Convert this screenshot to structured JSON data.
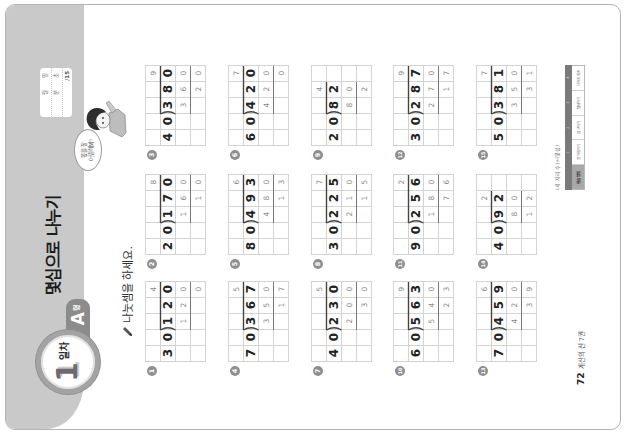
{
  "header": {
    "day_number": "1",
    "day_label": "일차",
    "type_letter": "A",
    "type_suffix": "형",
    "title": "몇십으로 나누기"
  },
  "score_box": {
    "month_label": "월",
    "day_label": "일",
    "minute_label": "분",
    "second_label": "초",
    "score_total": "/15"
  },
  "mascot": {
    "speech_line1": "몫을 잘",
    "speech_line2": "어림해봐!"
  },
  "instruction": {
    "icon": "pencil-icon",
    "text": "나눗셈을 하세요."
  },
  "problems": [
    {
      "number": "1",
      "divisor": "30",
      "dividend": "120",
      "quotient": "4",
      "product": "120",
      "remainder": "0",
      "rows": [
        [
          "",
          "",
          "",
          "",
          "4"
        ],
        [
          "3",
          "0",
          "1",
          "2",
          "0"
        ],
        [
          "",
          "",
          "1",
          "2",
          "0"
        ],
        [
          "",
          "",
          "",
          "",
          "0"
        ]
      ]
    },
    {
      "number": "2",
      "divisor": "20",
      "dividend": "170",
      "quotient": "8",
      "product": "160",
      "remainder": "10",
      "rows": [
        [
          "",
          "",
          "",
          "",
          "8"
        ],
        [
          "2",
          "0",
          "1",
          "7",
          "0"
        ],
        [
          "",
          "",
          "1",
          "6",
          "0"
        ],
        [
          "",
          "",
          "",
          "1",
          "0"
        ]
      ]
    },
    {
      "number": "3",
      "divisor": "40",
      "dividend": "380",
      "quotient": "9",
      "product": "360",
      "remainder": "20",
      "rows": [
        [
          "",
          "",
          "",
          "",
          "9"
        ],
        [
          "4",
          "0",
          "3",
          "8",
          "0"
        ],
        [
          "",
          "",
          "3",
          "6",
          "0"
        ],
        [
          "",
          "",
          "",
          "2",
          "0"
        ]
      ]
    },
    {
      "number": "4",
      "divisor": "70",
      "dividend": "367",
      "quotient": "5",
      "product": "350",
      "remainder": "17",
      "rows": [
        [
          "",
          "",
          "",
          "",
          "5"
        ],
        [
          "7",
          "0",
          "3",
          "6",
          "7"
        ],
        [
          "",
          "",
          "3",
          "5",
          "0"
        ],
        [
          "",
          "",
          "",
          "1",
          "7"
        ]
      ]
    },
    {
      "number": "5",
      "divisor": "80",
      "dividend": "493",
      "quotient": "6",
      "product": "480",
      "remainder": "13",
      "rows": [
        [
          "",
          "",
          "",
          "",
          "6"
        ],
        [
          "8",
          "0",
          "4",
          "9",
          "3"
        ],
        [
          "",
          "",
          "4",
          "8",
          "0"
        ],
        [
          "",
          "",
          "",
          "1",
          "3"
        ]
      ]
    },
    {
      "number": "6",
      "divisor": "60",
      "dividend": "420",
      "quotient": "7",
      "product": "420",
      "remainder": "0",
      "rows": [
        [
          "",
          "",
          "",
          "",
          "7"
        ],
        [
          "6",
          "0",
          "4",
          "2",
          "0"
        ],
        [
          "",
          "",
          "4",
          "2",
          "0"
        ],
        [
          "",
          "",
          "",
          "",
          "0"
        ]
      ]
    },
    {
      "number": "7",
      "divisor": "40",
      "dividend": "230",
      "quotient": "5",
      "product": "200",
      "remainder": "30",
      "rows": [
        [
          "",
          "",
          "",
          "",
          "5"
        ],
        [
          "4",
          "0",
          "2",
          "3",
          "0"
        ],
        [
          "",
          "",
          "2",
          "0",
          "0"
        ],
        [
          "",
          "",
          "",
          "3",
          "0"
        ]
      ]
    },
    {
      "number": "8",
      "divisor": "30",
      "dividend": "225",
      "quotient": "7",
      "product": "210",
      "remainder": "15",
      "rows": [
        [
          "",
          "",
          "",
          "",
          "7"
        ],
        [
          "3",
          "0",
          "2",
          "2",
          "5"
        ],
        [
          "",
          "",
          "2",
          "1",
          "0"
        ],
        [
          "",
          "",
          "",
          "1",
          "5"
        ]
      ]
    },
    {
      "number": "9",
      "divisor": "20",
      "dividend": "82",
      "quotient": "4",
      "product": "80",
      "remainder": "2",
      "rows": [
        [
          "",
          "",
          "",
          "4",
          ""
        ],
        [
          "2",
          "0",
          "8",
          "2",
          ""
        ],
        [
          "",
          "",
          "8",
          "0",
          ""
        ],
        [
          "",
          "",
          "",
          "2",
          ""
        ]
      ]
    },
    {
      "number": "10",
      "divisor": "60",
      "dividend": "563",
      "quotient": "9",
      "product": "540",
      "remainder": "23",
      "rows": [
        [
          "",
          "",
          "",
          "",
          "9"
        ],
        [
          "6",
          "0",
          "5",
          "6",
          "3"
        ],
        [
          "",
          "",
          "5",
          "4",
          "0"
        ],
        [
          "",
          "",
          "",
          "2",
          "3"
        ]
      ]
    },
    {
      "number": "11",
      "divisor": "90",
      "dividend": "256",
      "quotient": "2",
      "product": "180",
      "remainder": "76",
      "rows": [
        [
          "",
          "",
          "",
          "",
          "2"
        ],
        [
          "9",
          "0",
          "2",
          "5",
          "6"
        ],
        [
          "",
          "",
          "1",
          "8",
          "0"
        ],
        [
          "",
          "",
          "",
          "7",
          "6"
        ]
      ]
    },
    {
      "number": "12",
      "divisor": "30",
      "dividend": "287",
      "quotient": "9",
      "product": "270",
      "remainder": "17",
      "rows": [
        [
          "",
          "",
          "",
          "",
          "9"
        ],
        [
          "3",
          "0",
          "2",
          "8",
          "7"
        ],
        [
          "",
          "",
          "2",
          "7",
          "0"
        ],
        [
          "",
          "",
          "",
          "1",
          "7"
        ]
      ]
    },
    {
      "number": "13",
      "divisor": "70",
      "dividend": "459",
      "quotient": "6",
      "product": "420",
      "remainder": "39",
      "rows": [
        [
          "",
          "",
          "",
          "",
          "6"
        ],
        [
          "7",
          "0",
          "4",
          "5",
          "9"
        ],
        [
          "",
          "",
          "4",
          "2",
          "0"
        ],
        [
          "",
          "",
          "",
          "3",
          "9"
        ]
      ]
    },
    {
      "number": "14",
      "divisor": "40",
      "dividend": "92",
      "quotient": "2",
      "product": "80",
      "remainder": "12",
      "rows": [
        [
          "",
          "",
          "",
          "2",
          ""
        ],
        [
          "4",
          "0",
          "9",
          "2",
          ""
        ],
        [
          "",
          "",
          "8",
          "0",
          ""
        ],
        [
          "",
          "",
          "1",
          "2",
          ""
        ]
      ]
    },
    {
      "number": "15",
      "divisor": "50",
      "dividend": "381",
      "quotient": "7",
      "product": "350",
      "remainder": "31",
      "rows": [
        [
          "",
          "",
          "",
          "",
          "7"
        ],
        [
          "5",
          "0",
          "3",
          "8",
          "1"
        ],
        [
          "",
          "",
          "3",
          "5",
          "0"
        ],
        [
          "",
          "",
          "",
          "3",
          "1"
        ]
      ]
    }
  ],
  "footer": {
    "page_number": "72",
    "book_title": "계산의 신 7권",
    "note": "(세 자리 수)÷(몇십)",
    "table": {
      "headers": [
        "",
        "1",
        "2",
        "3",
        "4"
      ],
      "label": "학습 방법",
      "cells": [
        "몫 어림하기",
        "곱 구하기",
        "뺄셈하기",
        "나머지 확인"
      ]
    }
  },
  "colors": {
    "band": "#c9c9c9",
    "badge_ring": "#a3a3a3",
    "tab": "#8b8b8b",
    "grid_line": "#d3d3d3",
    "digit": "#222222",
    "answer_digit": "#8a8a8a"
  }
}
